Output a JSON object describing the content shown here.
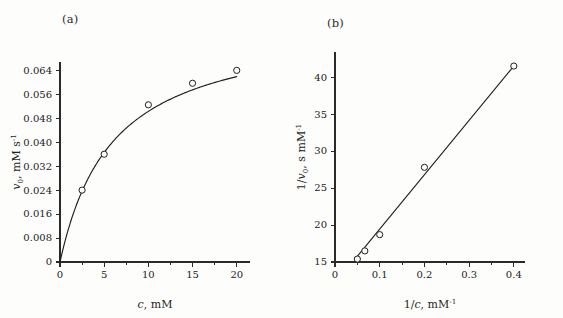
{
  "figure": {
    "background_color": "#fdfdfc",
    "ink_color": "#1f1f1f",
    "panels": [
      {
        "tag": "(a)"
      },
      {
        "tag": "(b)"
      }
    ]
  },
  "chart_data": [
    {
      "type": "scatter",
      "panel": "(a)",
      "title": "",
      "xlabel": "c, mM",
      "ylabel": "v0, mM s-1",
      "xlabel_parts": {
        "italic": "c",
        "rest": ", mM"
      },
      "ylabel_parts": {
        "italic": "v",
        "subscript": "0",
        "rest": ", mM s",
        "superscript": "-1"
      },
      "xlim": [
        0,
        21.5
      ],
      "ylim": [
        0,
        0.0668
      ],
      "xticks": [
        0,
        5,
        10,
        15,
        20
      ],
      "xticklabels": [
        "0",
        "5",
        "10",
        "15",
        "20"
      ],
      "xminorticks": [
        2.5,
        7.5,
        12.5,
        17.5
      ],
      "yticks": [
        0,
        0.008,
        0.016,
        0.024,
        0.032,
        0.04,
        0.048,
        0.056,
        0.064
      ],
      "yticklabels": [
        "0",
        "0.008",
        "0.016",
        "0.024",
        "0.032",
        "0.040",
        "0.048",
        "0.056",
        "0.064"
      ],
      "grid": false,
      "legend": "none",
      "x": [
        2.5,
        5,
        10,
        15,
        20
      ],
      "values": [
        0.024,
        0.036,
        0.0525,
        0.0597,
        0.064
      ],
      "fit": {
        "model": "michaelis-menten",
        "vmax": 0.0805,
        "km": 6.0,
        "description": "v0 = Vmax*c/(Km+c)"
      },
      "marker": "open-circle"
    },
    {
      "type": "scatter",
      "panel": "(b)",
      "title": "",
      "xlabel": "1/c, mM-1",
      "ylabel": "1/v0, s mM-1",
      "xlabel_parts": {
        "lead": "1/",
        "italic": "c",
        "rest": ", mM",
        "superscript": "-1"
      },
      "ylabel_parts": {
        "lead": "1/",
        "italic": "v",
        "subscript": "0",
        "rest": ", s mM",
        "superscript": "-1"
      },
      "xlim": [
        0,
        0.425
      ],
      "ylim": [
        15,
        43.4
      ],
      "xticks": [
        0,
        0.1,
        0.2,
        0.3,
        0.4
      ],
      "xticklabels": [
        "0",
        "0.1",
        "0.2",
        "0.3",
        "0.4"
      ],
      "xminorticks": [
        0.05,
        0.15,
        0.25,
        0.35
      ],
      "yticks": [
        15,
        20,
        25,
        30,
        35,
        40
      ],
      "yticklabels": [
        "15",
        "20",
        "25",
        "30",
        "35",
        "40"
      ],
      "grid": false,
      "legend": "none",
      "x": [
        0.05,
        0.0667,
        0.1,
        0.2,
        0.4
      ],
      "values": [
        15.4,
        16.5,
        18.7,
        27.8,
        41.5
      ],
      "fit": {
        "model": "linear",
        "intercept": 12.1,
        "slope": 73.5,
        "x_start": 0.045,
        "x_end": 0.4,
        "description": "1/v0 = 1/Vmax + (Km/Vmax)*(1/c)"
      },
      "marker": "open-circle"
    }
  ]
}
